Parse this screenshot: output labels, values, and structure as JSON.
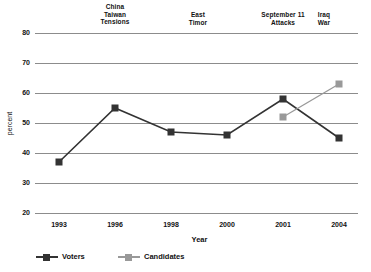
{
  "chart_data": {
    "type": "line",
    "title": "",
    "xlabel": "Year",
    "ylabel": "percent",
    "categories": [
      "1993",
      "1996",
      "1998",
      "2000",
      "2001",
      "2004"
    ],
    "ylim": [
      20,
      80
    ],
    "yticks": [
      20,
      30,
      40,
      50,
      60,
      70,
      80
    ],
    "grid": true,
    "legend_position": "bottom-left",
    "series": [
      {
        "name": "Voters",
        "color": "#333333",
        "marker": "square",
        "values": [
          37,
          55,
          47,
          46,
          58,
          45
        ]
      },
      {
        "name": "Candidates",
        "color": "#999999",
        "marker": "square",
        "values": [
          null,
          null,
          null,
          null,
          52,
          63
        ]
      }
    ],
    "annotations": [
      {
        "text": "China\nTaiwan\nTensions",
        "category": "1996"
      },
      {
        "text": "East\nTimor",
        "category": "2000"
      },
      {
        "text": "September 11\nAttacks",
        "category": "2001"
      },
      {
        "text": "Iraq\nWar",
        "category": "2004"
      }
    ]
  },
  "colors": {
    "voters": "#333333",
    "candidates": "#999999",
    "grid": "#8c8c8c",
    "text": "#111111",
    "background": "#ffffff"
  }
}
